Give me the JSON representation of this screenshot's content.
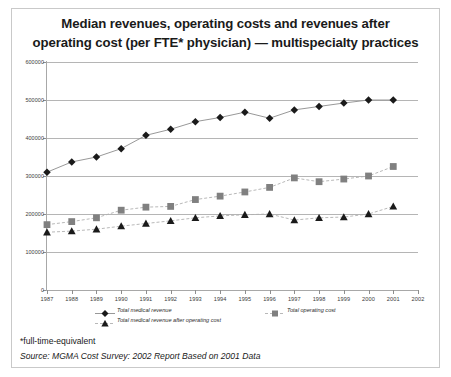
{
  "chart_data": {
    "type": "line",
    "title": "Median revenues, operating costs and revenues after operating cost (per FTE* physician) — multispecialty practices",
    "title_lines": [
      "Median revenues, operating costs and revenues after",
      "operating cost (per FTE* physician) — multispecialty practices"
    ],
    "xlabel": "",
    "ylabel": "",
    "x": [
      1987,
      1988,
      1989,
      1990,
      1991,
      1992,
      1993,
      1994,
      1995,
      1996,
      1997,
      1998,
      1999,
      2000,
      2001
    ],
    "xlim": [
      1987,
      2002
    ],
    "ylim": [
      0,
      600000
    ],
    "xtick_labels": [
      "1987",
      "1988",
      "1989",
      "1990",
      "1991",
      "1992",
      "1993",
      "1994",
      "1995",
      "1996",
      "1997",
      "1998",
      "1999",
      "2000",
      "2001",
      "2002"
    ],
    "ytick_labels": [
      "0",
      "100000",
      "200000",
      "300000",
      "400000",
      "500000",
      "600000"
    ],
    "ytick_values": [
      0,
      100000,
      200000,
      300000,
      400000,
      500000,
      600000
    ],
    "grid": true,
    "legend_position": "below-axis",
    "series": [
      {
        "name": "Total medical revenue",
        "marker": "diamond",
        "color": "#1a1a1a",
        "line_color": "#8c8c8c",
        "line_style": "solid",
        "values": [
          310000,
          337000,
          350000,
          372000,
          407000,
          423000,
          443000,
          454000,
          468000,
          452000,
          474000,
          483000,
          492000,
          500000,
          500000
        ]
      },
      {
        "name": "Total operating cost",
        "marker": "square",
        "color": "#808080",
        "line_color": "#b0b0b0",
        "line_style": "dashed",
        "values": [
          172000,
          180000,
          190000,
          210000,
          218000,
          220000,
          238000,
          247000,
          258000,
          270000,
          295000,
          285000,
          292000,
          300000,
          325000
        ]
      },
      {
        "name": "Total medical revenue after operating cost",
        "marker": "triangle",
        "color": "#1a1a1a",
        "line_color": "#b0b0b0",
        "line_style": "dashed",
        "values": [
          152000,
          155000,
          160000,
          168000,
          175000,
          182000,
          190000,
          195000,
          198000,
          200000,
          184000,
          190000,
          192000,
          200000,
          220000
        ]
      }
    ]
  },
  "footer": {
    "footnote": "*full-time-equivalent",
    "source": "Source: MGMA Cost Survey: 2002 Report Based on 2001 Data"
  }
}
